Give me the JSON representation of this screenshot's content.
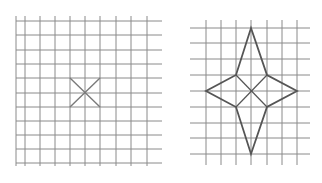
{
  "figures": [
    {
      "name": "left-grid",
      "grid_color": "#8a8a8a",
      "vertical_lines_x": [
        16,
        25,
        40,
        55,
        70,
        85,
        100,
        116,
        131,
        147
      ],
      "vertical_y_range": [
        16,
        166
      ],
      "horizontal_lines_y": [
        21,
        35,
        50,
        64,
        78,
        93,
        107,
        121,
        135,
        149,
        163
      ],
      "horizontal_x_range": [
        16,
        162
      ],
      "shape": {
        "type": "x-cross",
        "stroke": "#7a7a7a",
        "segments": [
          [
            [
              70,
              78
            ],
            [
              100,
              107
            ]
          ],
          [
            [
              100,
              78
            ],
            [
              70,
              107
            ]
          ]
        ]
      }
    },
    {
      "name": "right-grid",
      "grid_color": "#8a8a8a",
      "vertical_lines_x": [
        206,
        221,
        236,
        251,
        267,
        282,
        297
      ],
      "vertical_y_range": [
        20,
        165
      ],
      "horizontal_lines_y": [
        28,
        43,
        59,
        75,
        91,
        107,
        123,
        138,
        154
      ],
      "horizontal_x_range": [
        190,
        310
      ],
      "shape": {
        "type": "four-point-star",
        "stroke": "#555555",
        "outline": [
          [
            251,
            28
          ],
          [
            267,
            75
          ],
          [
            297,
            91
          ],
          [
            267,
            107
          ],
          [
            251,
            154
          ],
          [
            236,
            107
          ],
          [
            206,
            91
          ],
          [
            236,
            75
          ]
        ],
        "inner_segments": [
          [
            [
              236,
              75
            ],
            [
              267,
              107
            ]
          ],
          [
            [
              267,
              75
            ],
            [
              236,
              107
            ]
          ]
        ]
      }
    }
  ]
}
